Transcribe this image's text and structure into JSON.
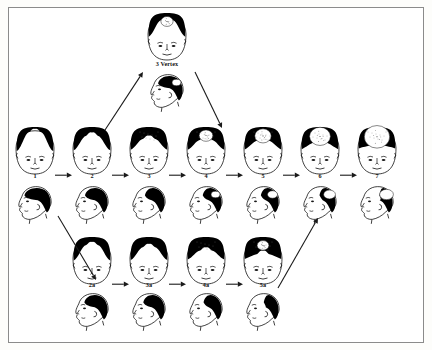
{
  "diagram": {
    "background_color": "#ffffff",
    "border_color": "#8b8b8b",
    "hair_color": "#000000",
    "skin_color": "#ffffff",
    "outline_color": "#111111"
  },
  "vertex_node": {
    "label": "3 Vertex",
    "x": 148,
    "y": 14,
    "crown_thinning": true,
    "description": "front view with full hair and small crown thinning spot, plus left-facing profile below"
  },
  "main_row": {
    "y_front": 128,
    "y_label": 172,
    "y_profile": 182,
    "items": [
      {
        "label": "1",
        "x": 16,
        "front_recession": 0.0,
        "crown_bald": 0.0
      },
      {
        "label": "2",
        "x": 73,
        "front_recession": 0.22,
        "crown_bald": 0.0
      },
      {
        "label": "3",
        "x": 130,
        "front_recession": 0.4,
        "crown_bald": 0.0
      },
      {
        "label": "4",
        "x": 187,
        "front_recession": 0.45,
        "crown_bald": 0.3
      },
      {
        "label": "5",
        "x": 244,
        "front_recession": 0.52,
        "crown_bald": 0.45
      },
      {
        "label": "6",
        "x": 301,
        "front_recession": 0.62,
        "crown_bald": 0.68
      },
      {
        "label": "7",
        "x": 358,
        "front_recession": 0.8,
        "crown_bald": 0.92
      }
    ]
  },
  "lower_row": {
    "y_front": 240,
    "y_label": 281,
    "y_profile": 291,
    "items": [
      {
        "label": "2a",
        "x": 73,
        "front_recession": 0.18,
        "crown_bald": 0.0
      },
      {
        "label": "3a",
        "x": 130,
        "front_recession": 0.3,
        "crown_bald": 0.0
      },
      {
        "label": "4a",
        "x": 187,
        "front_recession": 0.5,
        "crown_bald": 0.0
      },
      {
        "label": "5a",
        "x": 244,
        "front_recession": 0.7,
        "crown_bald": 0.2
      }
    ]
  },
  "connections": [
    {
      "name": "arrow-1-to-2",
      "type": "horizontal"
    },
    {
      "name": "arrow-2-to-3",
      "type": "horizontal"
    },
    {
      "name": "arrow-3-to-4",
      "type": "horizontal"
    },
    {
      "name": "arrow-4-to-5",
      "type": "horizontal"
    },
    {
      "name": "arrow-5-to-6",
      "type": "horizontal"
    },
    {
      "name": "arrow-6-to-7",
      "type": "horizontal"
    },
    {
      "name": "arrow-2a-to-3a",
      "type": "horizontal"
    },
    {
      "name": "arrow-3a-to-4a",
      "type": "horizontal"
    },
    {
      "name": "arrow-4a-to-5a",
      "type": "horizontal"
    },
    {
      "name": "arrow-2-to-vertex",
      "type": "diagonal-up"
    },
    {
      "name": "arrow-vertex-to-4",
      "type": "diagonal-down"
    },
    {
      "name": "arrow-1-to-2a",
      "type": "diagonal-down"
    },
    {
      "name": "arrow-5a-to-6",
      "type": "diagonal-up"
    }
  ]
}
